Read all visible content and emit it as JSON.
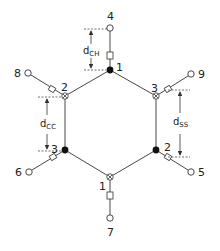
{
  "diagram": {
    "type": "benzene-ring-bond-diagram",
    "ring_carbons": [
      {
        "id": "c-top",
        "label": "1",
        "x": 110,
        "y": 70,
        "style": "filled"
      },
      {
        "id": "c-upper-left",
        "label": "2",
        "x": 65,
        "y": 96,
        "style": "open-cross"
      },
      {
        "id": "c-upper-right",
        "label": "3",
        "x": 156,
        "y": 96,
        "style": "open-cross"
      },
      {
        "id": "c-lower-left",
        "label": "3",
        "x": 65,
        "y": 150,
        "style": "filled"
      },
      {
        "id": "c-lower-right",
        "label": "2",
        "x": 156,
        "y": 150,
        "style": "filled"
      },
      {
        "id": "c-bottom",
        "label": "1",
        "x": 110,
        "y": 177,
        "style": "open-cross"
      }
    ],
    "hydrogens": [
      {
        "label": "4",
        "x": 110,
        "y": 28
      },
      {
        "label": "8",
        "x": 28,
        "y": 73
      },
      {
        "label": "9",
        "x": 191,
        "y": 74
      },
      {
        "label": "6",
        "x": 29,
        "y": 172
      },
      {
        "label": "5",
        "x": 191,
        "y": 172
      },
      {
        "label": "7",
        "x": 110,
        "y": 218
      }
    ],
    "dimensions": {
      "d_ch": {
        "main": "d",
        "sub": "CH"
      },
      "d_cc": {
        "main": "d",
        "sub": "CC"
      },
      "d_ss": {
        "main": "d",
        "sub": "SS"
      }
    },
    "colors": {
      "line": "#333333",
      "node_fill": "#111111",
      "background": "#ffffff"
    }
  }
}
